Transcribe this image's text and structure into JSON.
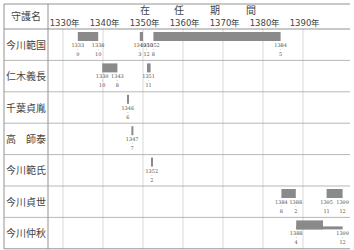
{
  "chart_data": {
    "type": "gantt",
    "name_header": "守護名",
    "ticks": [
      "1330年",
      "1340年",
      "1350年",
      "1360年",
      "1370年",
      "1380年",
      "1390年"
    ],
    "tick_years": [
      1330,
      1340,
      1350,
      1360,
      1370,
      1380,
      1390
    ],
    "xlim": [
      1327,
      1400.5
    ],
    "rows": [
      {
        "name": "今川範国",
        "bars": [
          {
            "start": 1333.7,
            "end": 1338.8,
            "labels": [
              {
                "year": "1333",
                "month": "9",
                "at": 1333.7
              },
              {
                "year": "1338",
                "month": "10",
                "at": 1338.8
              }
            ]
          },
          {
            "start": 1349.2,
            "end": 1350.0,
            "labels": [
              {
                "year": "1349",
                "month": "3",
                "at": 1349.2
              },
              {
                "year": "1350",
                "month": "12",
                "at": 1350.9
              }
            ]
          },
          {
            "start": 1352.6,
            "end": 1384.4,
            "labels": [
              {
                "year": "1352",
                "month": "8",
                "at": 1352.6
              },
              {
                "year": "1384",
                "month": "5",
                "at": 1384.4
              }
            ]
          }
        ]
      },
      {
        "name": "仁木義長",
        "bars": [
          {
            "start": 1339.8,
            "end": 1343.6,
            "labels": [
              {
                "year": "1339",
                "month": "10",
                "at": 1339.8
              },
              {
                "year": "1343",
                "month": "8",
                "at": 1343.6
              }
            ]
          },
          {
            "start": 1351.0,
            "end": 1351.9,
            "labels": [
              {
                "year": "1351",
                "month": "11",
                "at": 1351.4
              }
            ]
          }
        ]
      },
      {
        "name": "千葉貞胤",
        "bars": [
          {
            "start": 1346.0,
            "end": 1346.5,
            "labels": [
              {
                "year": "1346",
                "month": "6",
                "at": 1346.2
              }
            ]
          }
        ]
      },
      {
        "name": "高　師泰",
        "bars": [
          {
            "start": 1347.1,
            "end": 1347.6,
            "labels": [
              {
                "year": "1347",
                "month": "7",
                "at": 1347.3
              }
            ]
          }
        ]
      },
      {
        "name": "今川範氏",
        "bars": [
          {
            "start": 1352.0,
            "end": 1352.5,
            "labels": [
              {
                "year": "1352",
                "month": "2",
                "at": 1352.2
              }
            ]
          }
        ]
      },
      {
        "name": "今川貞世",
        "bars": [
          {
            "start": 1384.6,
            "end": 1388.2,
            "labels": [
              {
                "year": "1384",
                "month": "8",
                "at": 1384.6
              },
              {
                "year": "1388",
                "month": "2",
                "at": 1388.2
              }
            ]
          },
          {
            "start": 1395.9,
            "end": 1399.9,
            "labels": [
              {
                "year": "1395",
                "month": "11",
                "at": 1395.9
              },
              {
                "year": "1399",
                "month": "12",
                "at": 1399.9
              }
            ]
          }
        ]
      },
      {
        "name": "今川仲秋",
        "bars": [
          {
            "start": 1388.3,
            "end": 1395.0,
            "labels": [
              {
                "year": "1388",
                "month": "4",
                "at": 1388.3
              }
            ]
          },
          {
            "start": 1388.3,
            "end": 1399.9,
            "thin": true,
            "labels": [
              {
                "year": "1399",
                "month": "12",
                "at": 1399.9
              }
            ]
          }
        ]
      }
    ],
    "bar_color": "#8a8a8a",
    "grid_color": "#aaaaaa"
  }
}
